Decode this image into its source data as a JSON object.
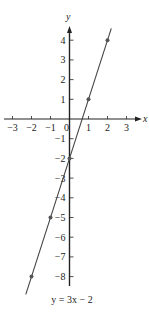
{
  "chart_data": {
    "type": "line",
    "title": "y = 3x − 2",
    "xlabel": "x",
    "ylabel": "y",
    "xlim": [
      -3,
      3
    ],
    "ylim": [
      -8,
      4
    ],
    "x_ticks": [
      -3,
      -2,
      -1,
      0,
      1,
      2,
      3
    ],
    "x_tick_labels": [
      "−3",
      "−2",
      "−1",
      "0",
      "1",
      "2",
      "3"
    ],
    "y_ticks": [
      -8,
      -7,
      -6,
      -5,
      -4,
      -3,
      -2,
      -1,
      1,
      2,
      3,
      4
    ],
    "y_tick_labels": [
      "−8",
      "−7",
      "−6",
      "−5",
      "−4",
      "−3",
      "−2",
      "−1",
      "1",
      "2",
      "3",
      "4"
    ],
    "grid": false,
    "series": [
      {
        "name": "y = 3x − 2",
        "equation": "y = 3x - 2",
        "points": [
          {
            "x": -2,
            "y": -8
          },
          {
            "x": -1,
            "y": -5
          },
          {
            "x": 0,
            "y": -2
          },
          {
            "x": 1,
            "y": 1
          },
          {
            "x": 2,
            "y": 4
          }
        ],
        "line_color": "#444444",
        "marker_color": "#555555"
      }
    ]
  },
  "labels": {
    "x_axis": "x",
    "y_axis": "y",
    "caption": "y = 3x − 2"
  }
}
